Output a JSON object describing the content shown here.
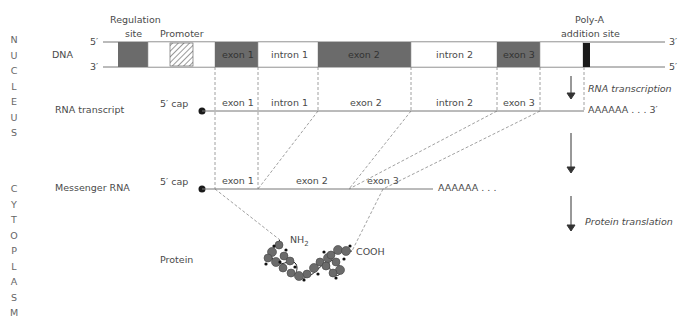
{
  "compartments": {
    "nucleus": [
      "N",
      "U",
      "C",
      "L",
      "E",
      "U",
      "S"
    ],
    "cytoplasm": [
      "C",
      "Y",
      "T",
      "O",
      "P",
      "L",
      "A",
      "S",
      "M"
    ]
  },
  "row_labels": {
    "dna": "DNA",
    "rna_transcript": "RNA transcript",
    "messenger_rna": "Messenger RNA",
    "protein": "Protein"
  },
  "dna": {
    "five_prime_top": "5′",
    "three_prime_bottom": "3′",
    "three_prime_top_right": "3′",
    "five_prime_bottom_right": "5′",
    "regulation_site_line1": "Regulation",
    "regulation_site_line2": "site",
    "promoter": "Promoter",
    "polya_line1": "Poly-A",
    "polya_line2": "addition site",
    "segments": [
      {
        "label": "exon 1",
        "type": "exon"
      },
      {
        "label": "intron 1",
        "type": "intron"
      },
      {
        "label": "exon 2",
        "type": "exon"
      },
      {
        "label": "intron 2",
        "type": "intron"
      },
      {
        "label": "exon 3",
        "type": "exon"
      }
    ]
  },
  "rna_transcript": {
    "cap": "5′ cap",
    "segments": [
      "exon 1",
      "intron 1",
      "exon 2",
      "intron 2",
      "exon 3"
    ],
    "tail": "AAAAAA . . . 3′"
  },
  "messenger_rna": {
    "cap": "5′ cap",
    "segments": [
      "exon 1",
      "exon 2",
      "exon 3"
    ],
    "tail": "AAAAAA . . ."
  },
  "protein": {
    "n_terminus": "NH",
    "n_subscript": "2",
    "c_terminus": "COOH"
  },
  "process_labels": {
    "transcription": "RNA transcription",
    "translation": "Protein translation"
  },
  "colors": {
    "exon_fill": "#6b6b6b",
    "line": "#777777",
    "polya_bar": "#1a1a1a",
    "cap_dot": "#1a1a1a"
  }
}
